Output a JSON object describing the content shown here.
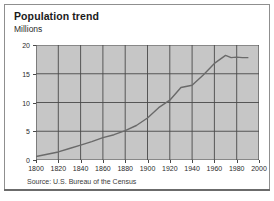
{
  "figure": {
    "title": "Population trend",
    "subtitle": "Millions",
    "source": "Source: U.S. Bureau of the Census"
  },
  "chart_data": {
    "type": "line",
    "title": "Population trend",
    "subtitle": "Millions",
    "xlabel": "",
    "ylabel": "Millions",
    "xlim": [
      1800,
      2000
    ],
    "ylim": [
      0,
      20
    ],
    "xticks": [
      1800,
      1820,
      1840,
      1860,
      1880,
      1900,
      1920,
      1940,
      1960,
      1980,
      2000
    ],
    "yticks": [
      0,
      5,
      10,
      15,
      20
    ],
    "xtick_labels": [
      "1800",
      "1820",
      "1840",
      "1860",
      "1880",
      "1900",
      "1920",
      "1940",
      "1960",
      "1980",
      "2000"
    ],
    "ytick_labels": [
      "0",
      "5",
      "10",
      "15",
      "20"
    ],
    "grid": true,
    "legend": false,
    "plot_background": "#c6c6c6",
    "line_color": "#6a6a6a",
    "grid_color": "#4a4a4a",
    "annotation": "Source: U.S. Bureau of the Census",
    "series": [
      {
        "name": "Population",
        "x": [
          1800,
          1810,
          1820,
          1830,
          1840,
          1850,
          1860,
          1870,
          1880,
          1890,
          1900,
          1910,
          1920,
          1930,
          1940,
          1950,
          1960,
          1970,
          1975,
          1980,
          1985,
          1990
        ],
        "values": [
          0.6,
          1.0,
          1.4,
          2.0,
          2.6,
          3.2,
          3.9,
          4.4,
          5.1,
          6.0,
          7.3,
          9.1,
          10.4,
          12.6,
          13.0,
          14.8,
          16.8,
          18.2,
          17.8,
          17.9,
          17.8,
          17.8
        ]
      }
    ]
  }
}
